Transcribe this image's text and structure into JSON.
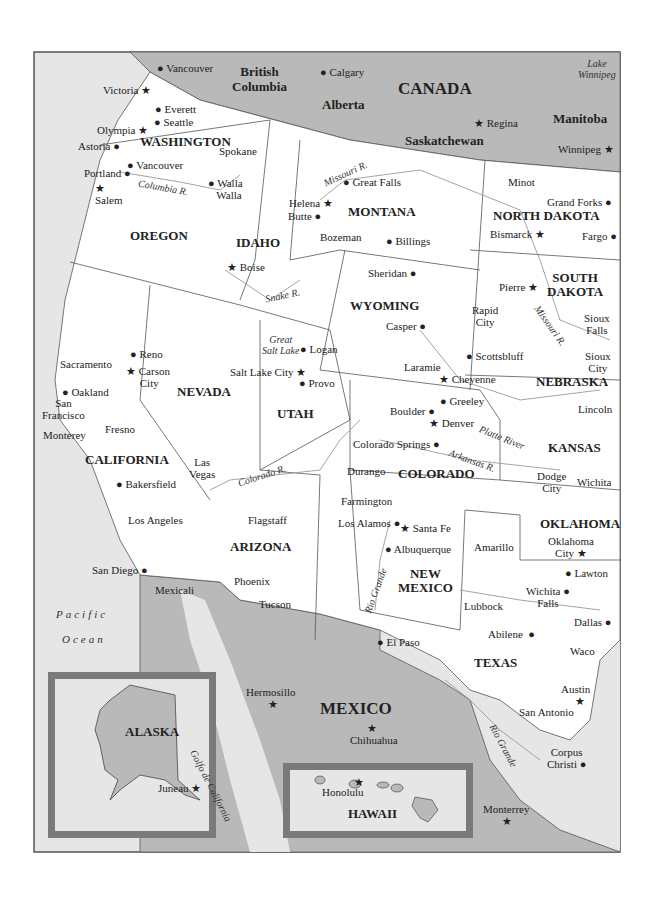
{
  "colors": {
    "land_us": "#ffffff",
    "land_foreign": "#b9b9b9",
    "water": "#e6e6e6",
    "border": "#555555",
    "river": "#9a9a9a",
    "inset_frame": "#7a7a7a"
  },
  "countries": {
    "canada": "CANADA",
    "mexico": "MEXICO"
  },
  "provinces": {
    "british_columbia": "British Columbia",
    "alberta": "Alberta",
    "saskatchewan": "Saskatchewan",
    "manitoba": "Manitoba"
  },
  "states": {
    "washington": "WASHINGTON",
    "oregon": "OREGON",
    "idaho": "IDAHO",
    "montana": "MONTANA",
    "north_dakota": "NORTH DAKOTA",
    "south_dakota_1": "SOUTH",
    "south_dakota_2": "DAKOTA",
    "wyoming": "WYOMING",
    "nebraska": "NEBRASKA",
    "nevada": "NEVADA",
    "utah": "UTAH",
    "colorado": "COLORADO",
    "kansas": "KANSAS",
    "california": "CALIFORNIA",
    "arizona": "ARIZONA",
    "new_mexico_1": "NEW",
    "new_mexico_2": "MEXICO",
    "oklahoma": "OKLAHOMA",
    "texas": "TEXAS"
  },
  "water_labels": {
    "pacific": "Pacific",
    "ocean": "Ocean",
    "lake_winnipeg_1": "Lake",
    "lake_winnipeg_2": "Winnipeg",
    "great_salt_lake_1": "Great",
    "great_salt_lake_2": "Salt Lake",
    "golfo": "Golfo de California"
  },
  "rivers": {
    "columbia": "Columbia R.",
    "missouri_mt": "Missouri R.",
    "missouri_sd": "Missouri R.",
    "snake": "Snake R.",
    "platte": "Platte River",
    "colorado": "Colorado R.",
    "arkansas": "Arkansas R.",
    "rio_grande_nm": "Rio Grande",
    "rio_grande_tx": "Rio Grande"
  },
  "cities": {
    "vancouver_bc": "Vancouver",
    "victoria": "Victoria",
    "calgary": "Calgary",
    "regina": "Regina",
    "winnipeg": "Winnipeg",
    "everett": "Everett",
    "seattle": "Seattle",
    "olympia": "Olympia",
    "astoria": "Astoria",
    "spokane": "Spokane",
    "vancouver_wa": "Vancouver",
    "portland": "Portland",
    "salem": "Salem",
    "walla_1": "Walla",
    "walla_2": "Walla",
    "helena": "Helena",
    "butte": "Butte",
    "great_falls": "Great Falls",
    "bozeman": "Bozeman",
    "billings": "Billings",
    "minot": "Minot",
    "grand_forks": "Grand Forks",
    "bismarck": "Bismarck",
    "fargo": "Fargo",
    "boise": "Boise",
    "sheridan": "Sheridan",
    "pierre": "Pierre",
    "rapid_city_1": "Rapid",
    "rapid_city_2": "City",
    "casper": "Casper",
    "sioux_falls_1": "Sioux",
    "sioux_falls_2": "Falls",
    "sioux_city_1": "Sioux",
    "sioux_city_2": "City",
    "scottsbluff": "Scottsbluff",
    "laramie": "Laramie",
    "cheyenne": "Cheyenne",
    "lincoln": "Lincoln",
    "logan": "Logan",
    "salt_lake_city": "Salt Lake City",
    "provo": "Provo",
    "reno": "Reno",
    "carson_city_1": "Carson",
    "carson_city_2": "City",
    "sacramento": "Sacramento",
    "oakland": "Oakland",
    "san_francisco_1": "San",
    "san_francisco_2": "Francisco",
    "monterey": "Monterey",
    "fresno": "Fresno",
    "greeley": "Greeley",
    "boulder": "Boulder",
    "denver": "Denver",
    "colorado_springs": "Colorado Springs",
    "durango": "Durango",
    "farmington": "Farmington",
    "las_vegas_1": "Las",
    "las_vegas_2": "Vegas",
    "bakersfield": "Bakersfield",
    "dodge_city_1": "Dodge",
    "dodge_city_2": "City",
    "wichita": "Wichita",
    "los_angeles": "Los Angeles",
    "flagstaff": "Flagstaff",
    "los_alamos": "Los Alamos",
    "santa_fe": "Santa Fe",
    "albuquerque": "Albuquerque",
    "amarillo": "Amarillo",
    "oklahoma_city_1": "Oklahoma",
    "oklahoma_city_2": "City",
    "lawton": "Lawton",
    "san_diego": "San Diego",
    "mexicali": "Mexicali",
    "phoenix": "Phoenix",
    "tucson": "Tucson",
    "wichita_falls_1": "Wichita",
    "wichita_falls_2": "Falls",
    "lubbock": "Lubbock",
    "abilene": "Abilene",
    "dallas": "Dallas",
    "el_paso": "El Paso",
    "waco": "Waco",
    "hermosillo": "Hermosillo",
    "chihuahua": "Chihuahua",
    "austin": "Austin",
    "san_antonio": "San Antonio",
    "corpus_christi_1": "Corpus",
    "corpus_christi_2": "Christi",
    "monterrey": "Monterrey",
    "juneau": "Juneau",
    "honolulu": "Honolulu"
  },
  "insets": {
    "alaska": "ALASKA",
    "hawaii": "HAWAII"
  }
}
